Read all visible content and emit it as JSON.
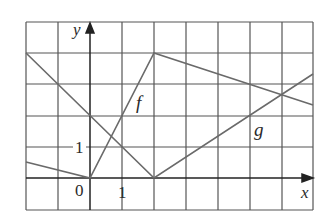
{
  "figure": {
    "axes": {
      "x_label": "x",
      "y_label": "y",
      "origin_label": "0",
      "x_tick_label": "1",
      "y_tick_label": "1",
      "x_range": [
        -2,
        7
      ],
      "y_range": [
        -1,
        5
      ],
      "grid": true
    },
    "curves": [
      {
        "name": "f",
        "label": "f",
        "points": [
          [
            -2,
            0.5
          ],
          [
            0,
            0
          ],
          [
            2,
            4
          ],
          [
            7,
            2.33
          ]
        ]
      },
      {
        "name": "g",
        "label": "g",
        "points": [
          [
            -2,
            4
          ],
          [
            2,
            0
          ],
          [
            7,
            3.33
          ]
        ]
      }
    ],
    "colors": {
      "grid": "#555555",
      "curve": "#6a6a6a",
      "text": "#2a2a2a"
    }
  }
}
